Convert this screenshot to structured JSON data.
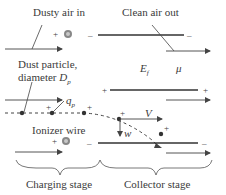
{
  "labels": {
    "dusty_air_in": "Dusty air in",
    "clean_air_out": "Clean air out",
    "dust_particle_line1": "Dust particle,",
    "dust_particle_line2": "diameter ",
    "Dp": "D",
    "Dp_sub": "p",
    "qp": "q",
    "qp_sub": "p",
    "Ef": "E",
    "Ef_sub": "f",
    "mu": "μ",
    "V": "V",
    "w": "w",
    "ionizer_wire": "Ionizer wire",
    "charging_stage": "Charging stage",
    "collector_stage": "Collector stage"
  },
  "signs": {
    "plus": "+",
    "minus": "–"
  },
  "colors": {
    "line": "#333333",
    "arrow": "#555555",
    "wire_outer": "#888888",
    "wire_inner": "#bbbbbb"
  }
}
